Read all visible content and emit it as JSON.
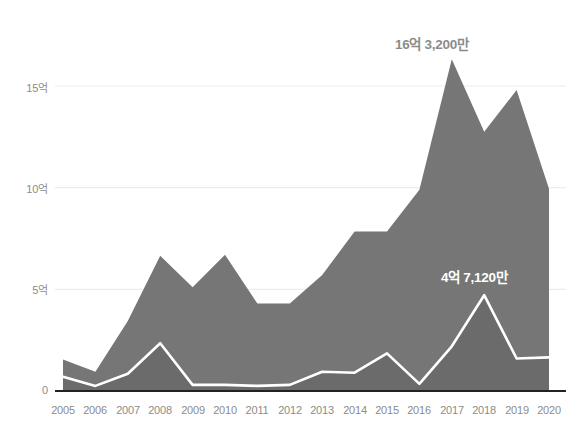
{
  "chart_data": {
    "type": "area",
    "title": "",
    "subtitle": "",
    "xlabel": "",
    "ylabel": "",
    "categories": [
      "2005",
      "2006",
      "2007",
      "2008",
      "2009",
      "2010",
      "2011",
      "2012",
      "2013",
      "2014",
      "2015",
      "2016",
      "2017",
      "2018",
      "2019",
      "2020"
    ],
    "x": [
      2005,
      2006,
      2007,
      2008,
      2009,
      2010,
      2011,
      2012,
      2013,
      2014,
      2015,
      2016,
      2017,
      2018,
      2019,
      2020
    ],
    "ylim": [
      0,
      17.5
    ],
    "y_unit": "억",
    "grid": true,
    "gridlines": [
      0,
      5,
      10,
      15
    ],
    "legend_position": "none",
    "series": [
      {
        "name": "outer-area",
        "fill_color": "#767676",
        "values": [
          1.55,
          0.95,
          3.45,
          6.65,
          5.1,
          6.7,
          4.3,
          4.3,
          5.7,
          7.85,
          7.85,
          9.9,
          16.32,
          12.75,
          14.8,
          9.95
        ]
      },
      {
        "name": "inner-area",
        "fill_color": "#6b6b6b",
        "line_color": "#ffffff",
        "values": [
          0.7,
          0.25,
          0.85,
          2.35,
          0.3,
          0.3,
          0.25,
          0.3,
          0.95,
          0.9,
          1.85,
          0.35,
          2.2,
          4.712,
          1.6,
          1.65
        ]
      }
    ],
    "y_ticks": [
      {
        "value": 0,
        "label": "0"
      },
      {
        "value": 5,
        "label": "5억"
      },
      {
        "value": 10,
        "label": "10억"
      },
      {
        "value": 15,
        "label": "15억"
      }
    ],
    "annotations": [
      {
        "text": "16억 3,200만",
        "series": "outer-area",
        "at_x": 2017,
        "at_y": 16.32,
        "color": "#8c8c8c"
      },
      {
        "text": "4억 7,120만",
        "series": "inner-area",
        "at_x": 2018,
        "at_y": 4.712,
        "color": "#ffffff"
      }
    ]
  },
  "axis_colors": {
    "baseline": "#222222",
    "gridline": "#ececec",
    "tick_text": "#8b8b8b"
  }
}
